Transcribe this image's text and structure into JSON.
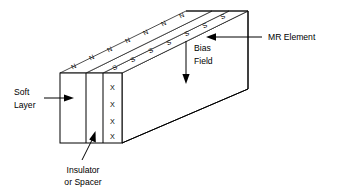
{
  "figure": {
    "background_color": "#ffffff",
    "line_color": "#000000",
    "width": 343,
    "height": 189
  },
  "labels": {
    "mr_element": "MR Element",
    "bias_field_line1": "Bias",
    "bias_field_line2": "Field",
    "soft_layer_line1": "Soft",
    "soft_layer_line2": "Layer",
    "insulator_line1": "Insulator",
    "insulator_line2": "or Spacer"
  },
  "magnetic_poles": {
    "north_label": "N",
    "south_label": "S",
    "north_count": 7,
    "south_count": 7,
    "north_row": [
      "N",
      "N",
      "N",
      "N",
      "N",
      "N",
      "N"
    ],
    "south_row": [
      "S",
      "S",
      "S",
      "S",
      "S",
      "S",
      "S"
    ]
  },
  "current_marks": {
    "symbol": "X",
    "count": 4,
    "marks": [
      "X",
      "X",
      "X",
      "X"
    ]
  },
  "layers": [
    {
      "name": "soft-layer",
      "label": "Soft Layer"
    },
    {
      "name": "insulator-spacer",
      "label": "Insulator or Spacer"
    },
    {
      "name": "mr-element",
      "label": "MR Element"
    }
  ]
}
